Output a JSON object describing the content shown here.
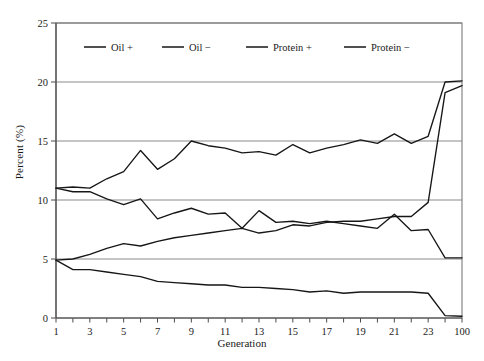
{
  "chart_data": {
    "type": "line",
    "title": "",
    "xlabel": "Generation",
    "ylabel": "Percent (%)",
    "xlim": [
      1,
      25
    ],
    "ylim": [
      0,
      25
    ],
    "yticks": [
      0,
      5,
      10,
      15,
      20,
      25
    ],
    "xticks": [
      1,
      2,
      3,
      4,
      5,
      6,
      7,
      8,
      9,
      10,
      11,
      12,
      13,
      14,
      15,
      16,
      17,
      18,
      19,
      20,
      21,
      22,
      23,
      24,
      25
    ],
    "xtick_labels": [
      "1",
      "",
      "3",
      "",
      "5",
      "",
      "7",
      "",
      "9",
      "",
      "11",
      "",
      "13",
      "",
      "15",
      "",
      "17",
      "",
      "19",
      "",
      "21",
      "",
      "23",
      "",
      "100"
    ],
    "grid": "horizontal",
    "legend_position": "top-inside",
    "x": [
      1,
      2,
      3,
      4,
      5,
      6,
      7,
      8,
      9,
      10,
      11,
      12,
      13,
      14,
      15,
      16,
      17,
      18,
      19,
      20,
      21,
      22,
      23,
      24,
      100
    ],
    "series": [
      {
        "name": "Oil +",
        "values": [
          4.9,
          4.1,
          4.1,
          3.9,
          3.7,
          3.5,
          3.1,
          3.0,
          2.9,
          2.8,
          2.8,
          2.6,
          2.6,
          2.5,
          2.4,
          2.2,
          2.3,
          2.1,
          2.2,
          2.2,
          2.2,
          2.2,
          2.1,
          0.2,
          0.15
        ]
      },
      {
        "name": "Oil −",
        "values": [
          4.9,
          5.0,
          5.4,
          5.9,
          6.3,
          6.1,
          6.5,
          6.8,
          7.0,
          7.2,
          7.4,
          7.6,
          7.2,
          7.4,
          7.9,
          7.8,
          8.1,
          8.2,
          8.2,
          8.4,
          8.6,
          8.6,
          9.8,
          19.1,
          19.7
        ]
      },
      {
        "name": "Protein +",
        "values": [
          11.0,
          11.1,
          11.0,
          11.8,
          12.4,
          14.2,
          12.6,
          13.5,
          15.0,
          14.6,
          14.4,
          14.0,
          14.1,
          13.8,
          14.7,
          14.0,
          14.4,
          14.7,
          15.1,
          14.8,
          15.6,
          14.8,
          15.4,
          20.0,
          20.1
        ]
      },
      {
        "name": "Protein −",
        "values": [
          11.0,
          10.7,
          10.7,
          10.1,
          9.6,
          10.1,
          8.4,
          8.9,
          9.3,
          8.8,
          8.9,
          7.6,
          9.1,
          8.1,
          8.2,
          8.0,
          8.2,
          8.0,
          7.8,
          7.6,
          8.8,
          7.4,
          7.5,
          5.1,
          5.1
        ]
      }
    ]
  },
  "axes": {
    "ylabel": "Percent (%)",
    "xlabel": "Generation"
  },
  "legend": {
    "items": [
      {
        "label": "Oil +"
      },
      {
        "label": "Oil −"
      },
      {
        "label": "Protein +"
      },
      {
        "label": "Protein −"
      }
    ]
  }
}
